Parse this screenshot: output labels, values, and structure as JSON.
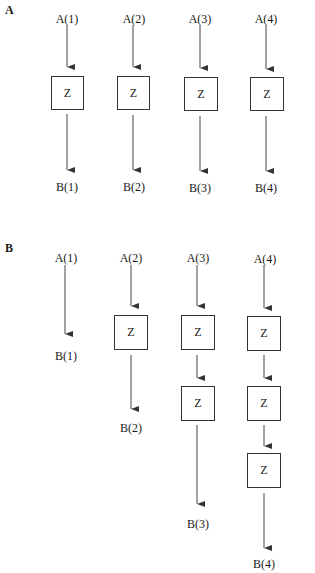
{
  "panels": [
    {
      "label": "A",
      "columns": [
        {
          "input": "A(1)",
          "output": "B(1)",
          "z_count": 1
        },
        {
          "input": "A(2)",
          "output": "B(2)",
          "z_count": 1
        },
        {
          "input": "A(3)",
          "output": "B(3)",
          "z_count": 1
        },
        {
          "input": "A(4)",
          "output": "B(4)",
          "z_count": 1
        }
      ]
    },
    {
      "label": "B",
      "columns": [
        {
          "input": "A(1)",
          "output": "B(1)",
          "z_count": 0
        },
        {
          "input": "A(2)",
          "output": "B(2)",
          "z_count": 1
        },
        {
          "input": "A(3)",
          "output": "B(3)",
          "z_count": 2
        },
        {
          "input": "A(4)",
          "output": "B(4)",
          "z_count": 3
        }
      ]
    }
  ],
  "box_text": "Z"
}
